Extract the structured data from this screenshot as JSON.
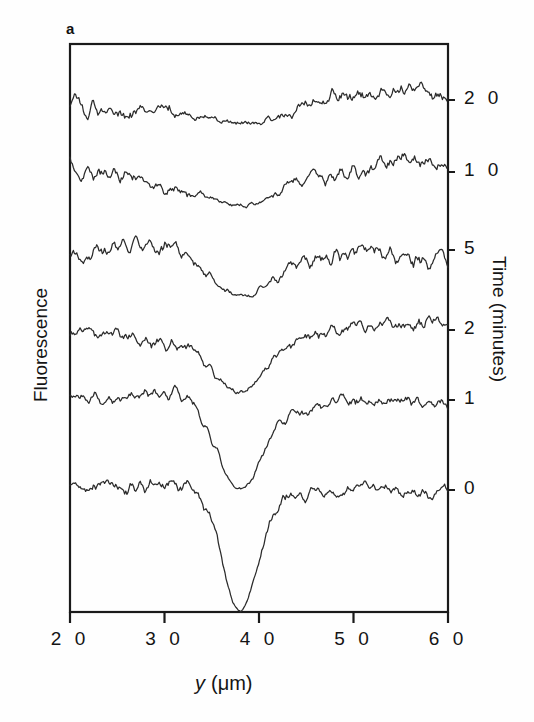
{
  "figure": {
    "panel_label": "a",
    "background_color": "#fefefe",
    "line_color": "#2b2b2b",
    "axis_color": "#1a1a1a"
  },
  "axes": {
    "left_title": "Fluorescence",
    "right_title": "Time (minutes)",
    "x_title_main": "y",
    "x_title_units": "(μm)",
    "x_ticks": [
      "2 0",
      "3 0",
      "4 0",
      "5 0",
      "6 0"
    ],
    "x_tick_values": [
      20,
      30,
      40,
      50,
      60
    ],
    "right_ticks": [
      "2 0",
      "1 0",
      "5",
      "2",
      "1",
      "0"
    ],
    "right_tick_values": [
      20,
      10,
      5,
      2,
      1,
      0
    ]
  },
  "chart_data": {
    "type": "line",
    "title": "",
    "subtitle": "",
    "xlabel": "y (μm)",
    "ylabel": "Fluorescence",
    "y2label": "Time (minutes)",
    "xlim": [
      2.0,
      6.0
    ],
    "xticks": [
      2.0,
      3.0,
      4.0,
      5.0,
      6.0
    ],
    "xticklabels": [
      "2 0",
      "3 0",
      "4 0",
      "5 0",
      "6 0"
    ],
    "grid": false,
    "legend": "none",
    "note": "Stacked FRAP line scans; each trace is offset vertically and annotated on the right axis with its time point in minutes. A photobleach dip centred near y = 3.8 um is deepest at t = 0 and recovers progressively by t = 20.",
    "bleach_center_um": 3.8,
    "series": [
      {
        "name": "20",
        "time_minutes": 20,
        "baseline_px": 100,
        "dip_depth_px": 26,
        "dip_width_um": 0.62,
        "noise_amp_px": 12,
        "seed": 17,
        "x": [
          2.0,
          2.04,
          2.08,
          2.12,
          2.16,
          2.2,
          2.24,
          2.28,
          2.32,
          2.36,
          2.4,
          2.44,
          2.48,
          2.52,
          2.56,
          2.6,
          2.64,
          2.68,
          2.72,
          2.76,
          2.8,
          2.84,
          2.88,
          2.92,
          2.96,
          3.0,
          3.04,
          3.08,
          3.12,
          3.16,
          3.2,
          3.24,
          3.28,
          3.32,
          3.36,
          3.4,
          3.44,
          3.48,
          3.52,
          3.56,
          3.6,
          3.64,
          3.68,
          3.72,
          3.76,
          3.8,
          3.84,
          3.88,
          3.92,
          3.96,
          4.0,
          4.04,
          4.08,
          4.12,
          4.16,
          4.2,
          4.24,
          4.28,
          4.32,
          4.36,
          4.4,
          4.44,
          4.48,
          4.52,
          4.56,
          4.6,
          4.64,
          4.68,
          4.72,
          4.76,
          4.8,
          4.84,
          4.88,
          4.92,
          4.96,
          5.0,
          5.04,
          5.08,
          5.12,
          5.16,
          5.2,
          5.24,
          5.28,
          5.32,
          5.36,
          5.4,
          5.44,
          5.48,
          5.52,
          5.56,
          5.6,
          5.64,
          5.68,
          5.72,
          5.76,
          5.8,
          5.84,
          5.88,
          5.92,
          5.96,
          6.0
        ]
      },
      {
        "name": "10",
        "time_minutes": 10,
        "baseline_px": 172,
        "dip_depth_px": 34,
        "dip_width_um": 0.58,
        "noise_amp_px": 12,
        "seed": 43
      },
      {
        "name": "5",
        "time_minutes": 5,
        "baseline_px": 250,
        "dip_depth_px": 46,
        "dip_width_um": 0.52,
        "noise_amp_px": 12,
        "seed": 91
      },
      {
        "name": "2",
        "time_minutes": 2,
        "baseline_px": 330,
        "dip_depth_px": 62,
        "dip_width_um": 0.46,
        "noise_amp_px": 11,
        "seed": 7
      },
      {
        "name": "1",
        "time_minutes": 1,
        "baseline_px": 400,
        "dip_depth_px": 88,
        "dip_width_um": 0.34,
        "noise_amp_px": 9,
        "seed": 55
      },
      {
        "name": "0",
        "time_minutes": 0,
        "baseline_px": 490,
        "dip_depth_px": 118,
        "dip_width_um": 0.26,
        "noise_amp_px": 9,
        "seed": 29
      }
    ]
  },
  "geometry": {
    "plot_left_px": 70,
    "plot_right_px": 448,
    "plot_top_px": 44,
    "plot_bottom_px": 612
  }
}
